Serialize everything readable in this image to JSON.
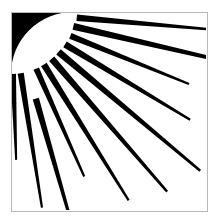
{
  "artwork": {
    "title": "Sunburst",
    "description": "Black and white clipart of a quarter sun in the upper-left corner emitting tapered straight rays",
    "style": "monochrome line art",
    "background_color": "#ffffff",
    "ink_color": "#000000",
    "border_color": "#b9b9b9",
    "canvas": {
      "width": 218,
      "height": 222
    },
    "frame": {
      "x": 11,
      "y": 12,
      "width": 196,
      "height": 199,
      "stroke_width": 1
    },
    "sun": {
      "shape": "quarter-disc",
      "origin_x": 11,
      "origin_y": 12,
      "radius": 62,
      "corner": "top-left",
      "color": "#000000"
    },
    "ray_count": 11,
    "rays": [
      {
        "id": 1,
        "angle_deg": 5,
        "length": 136,
        "base_width": 6.5,
        "tip_width": 2.4,
        "inner_radius": 66
      },
      {
        "id": 2,
        "angle_deg": 13,
        "length": 188,
        "base_width": 7.0,
        "tip_width": 2.6,
        "inner_radius": 64
      },
      {
        "id": 3,
        "angle_deg": 22,
        "length": 128,
        "base_width": 6.2,
        "tip_width": 2.2,
        "inner_radius": 64
      },
      {
        "id": 4,
        "angle_deg": 31,
        "length": 146,
        "base_width": 6.6,
        "tip_width": 2.3,
        "inner_radius": 63
      },
      {
        "id": 5,
        "angle_deg": 40,
        "length": 185,
        "base_width": 7.0,
        "tip_width": 2.5,
        "inner_radius": 62
      },
      {
        "id": 6,
        "angle_deg": 49,
        "length": 176,
        "base_width": 6.8,
        "tip_width": 2.4,
        "inner_radius": 62
      },
      {
        "id": 7,
        "angle_deg": 58,
        "length": 160,
        "base_width": 6.6,
        "tip_width": 2.3,
        "inner_radius": 62
      },
      {
        "id": 8,
        "angle_deg": 66,
        "length": 118,
        "base_width": 6.0,
        "tip_width": 2.2,
        "inner_radius": 62
      },
      {
        "id": 9,
        "angle_deg": 74,
        "length": 148,
        "base_width": 6.4,
        "tip_width": 2.3,
        "inner_radius": 90
      },
      {
        "id": 10,
        "angle_deg": 81,
        "length": 136,
        "base_width": 6.2,
        "tip_width": 2.2,
        "inner_radius": 62
      },
      {
        "id": 11,
        "angle_deg": 88,
        "length": 86,
        "base_width": 5.6,
        "tip_width": 2.0,
        "inner_radius": 62
      }
    ]
  }
}
